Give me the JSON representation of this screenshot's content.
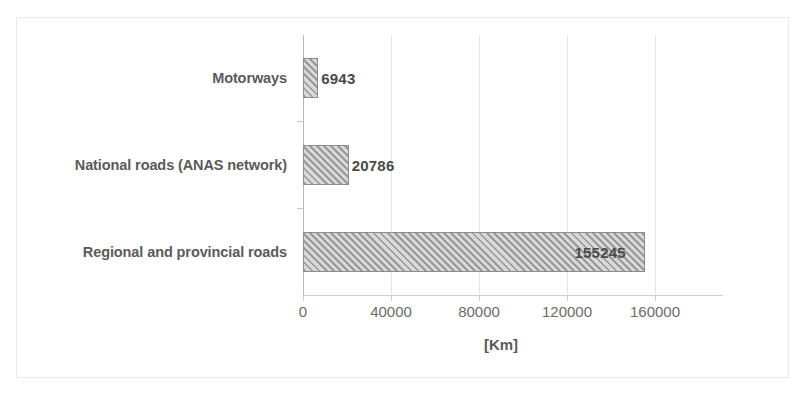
{
  "chart_data": {
    "type": "bar",
    "orientation": "horizontal",
    "title": "",
    "subtitle": "",
    "categories": [
      "Motorways",
      "National roads (ANAS network)",
      "Regional and provincial roads"
    ],
    "values": [
      6943,
      20786,
      155245
    ],
    "data_labels": [
      "6943",
      "20786",
      "155245"
    ],
    "xlabel": "[Km]",
    "ylabel": "",
    "xlim": [
      0,
      180000
    ],
    "xticks": [
      0,
      40000,
      80000,
      120000,
      160000
    ],
    "xticklabels": [
      "0",
      "40000",
      "80000",
      "120000",
      "160000"
    ],
    "grid": {
      "vertical": true,
      "horizontal": false
    },
    "legend": {
      "visible": false,
      "position": "none"
    },
    "series": [
      {
        "name": "Road length",
        "values": [
          6943,
          20786,
          155245
        ]
      }
    ],
    "style": {
      "bar_fill": "#cfcfcf",
      "bar_hatch": "diagonal-45",
      "bar_hatch_color": "#9a9a9a",
      "bar_border": "#8d8d8d",
      "gridline_color": "#e4e4e4",
      "axis_color": "#b9b9b9",
      "label_color": "#5a5a5a",
      "tick_color": "#6b6b6b",
      "frame_color": "#e9e9e9",
      "background": "#ffffff"
    }
  }
}
